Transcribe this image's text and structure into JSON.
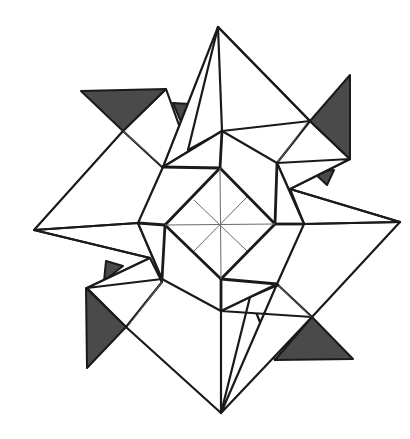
{
  "figure": {
    "colors": {
      "paper": "#ffffff",
      "line": "#1a1a1a",
      "shade": "#4a4a4a",
      "crease": "#6a6a6a"
    },
    "geometry": {
      "center": [
        220,
        225
      ],
      "long_points": {
        "top": [
          218,
          27
        ],
        "right": [
          400,
          222
        ],
        "bottom": [
          221,
          413
        ],
        "left": [
          34,
          230
        ]
      },
      "octagon": [
        [
          222,
          131
        ],
        [
          277,
          163
        ],
        [
          304,
          224
        ],
        [
          277,
          284
        ],
        [
          221,
          311
        ],
        [
          162,
          279
        ],
        [
          138,
          223
        ],
        [
          163,
          167
        ]
      ],
      "inner_square": [
        [
          220,
          168
        ],
        [
          275,
          224
        ],
        [
          221,
          279
        ],
        [
          165,
          225
        ]
      ]
    }
  }
}
